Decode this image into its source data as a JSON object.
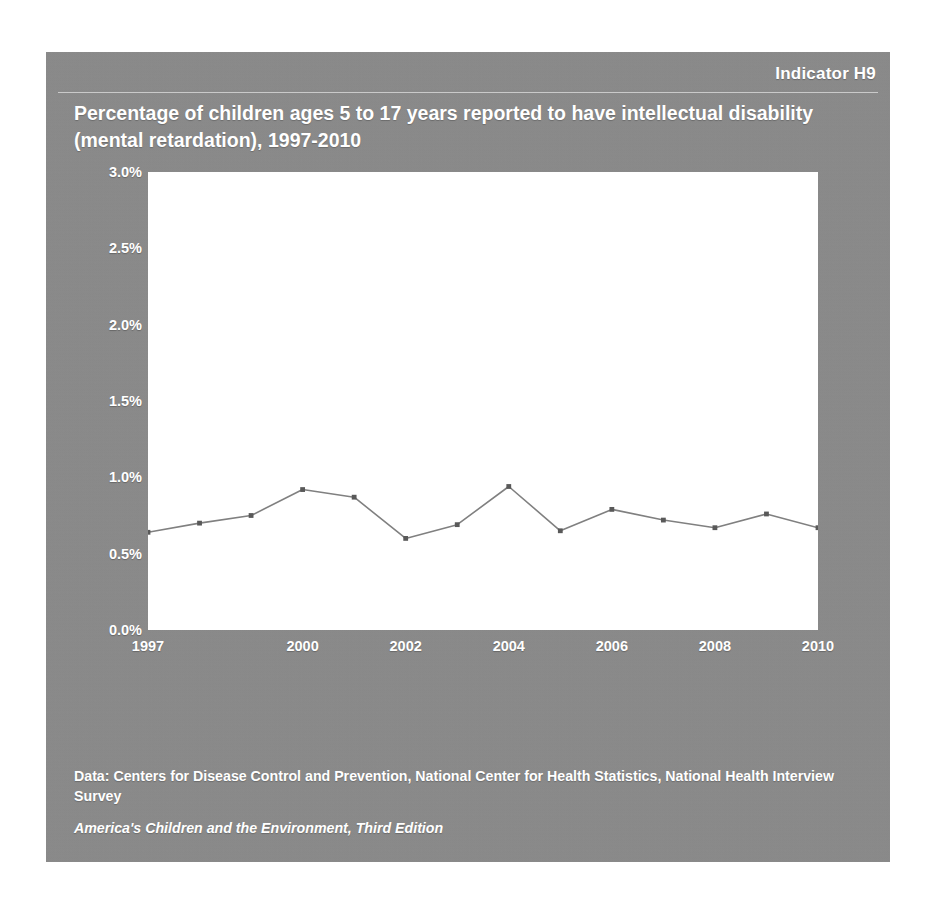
{
  "header": {
    "indicator": "Indicator H9"
  },
  "title": "Percentage of children ages 5 to 17 years reported to have intellectual disability (mental retardation), 1997-2010",
  "footer": {
    "source": "Data: Centers for Disease Control and Prevention, National Center for Health Statistics, National Health Interview Survey",
    "publication": "America's Children and the Environment, Third Edition"
  },
  "colors": {
    "panel_background": "#8a8a8a",
    "plot_background": "#ffffff",
    "line": "#808080",
    "marker": "#595959",
    "text": "#ffffff"
  },
  "chart_data": {
    "type": "line",
    "title": "Percentage of children ages 5 to 17 years reported to have intellectual disability (mental retardation), 1997-2010",
    "xlabel": "",
    "ylabel": "",
    "x": [
      1997,
      1998,
      1999,
      2000,
      2001,
      2002,
      2003,
      2004,
      2005,
      2006,
      2007,
      2008,
      2009,
      2010
    ],
    "series": [
      {
        "name": "Percentage of children ages 5 to 17 years with intellectual disability",
        "values": [
          0.64,
          0.7,
          0.75,
          0.92,
          0.87,
          0.6,
          0.69,
          0.94,
          0.65,
          0.79,
          0.72,
          0.67,
          0.76,
          0.67
        ]
      }
    ],
    "ylim": [
      0.0,
      3.0
    ],
    "yticks": [
      0.0,
      0.5,
      1.0,
      1.5,
      2.0,
      2.5,
      3.0
    ],
    "ytick_labels": [
      "0.0%",
      "0.5%",
      "1.0%",
      "1.5%",
      "2.0%",
      "2.5%",
      "3.0%"
    ],
    "xtick_labels": [
      "1997",
      "2000",
      "2002",
      "2004",
      "2006",
      "2008",
      "2010"
    ],
    "xticks": [
      1997,
      2000,
      2002,
      2004,
      2006,
      2008,
      2010
    ],
    "xlim": [
      1997,
      2010
    ],
    "grid": false,
    "legend": "none",
    "units": "percent"
  }
}
